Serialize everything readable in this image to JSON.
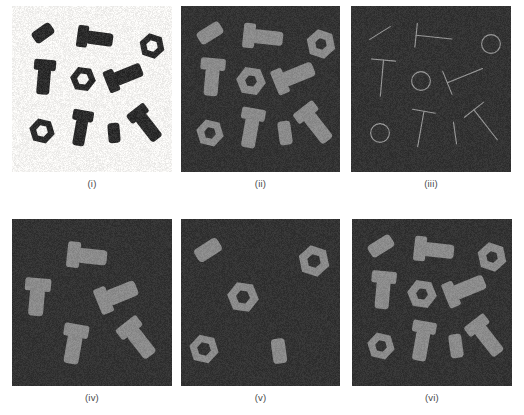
{
  "figure": {
    "width": 524,
    "height": 415,
    "background_color": "#ffffff"
  },
  "colors": {
    "original_background": "#f4f3f1",
    "original_object": "#2b2b2b",
    "binary_background": "#333333",
    "binary_object": "#8b8b8b",
    "skeleton_background": "#333333",
    "skeleton_line": "#9a9a9a",
    "caption_text": "#4a4a4a"
  },
  "panels": [
    {
      "id": "i",
      "caption": "(i)",
      "kind": "grayscale-original",
      "description": "Original grayscale image of bolts, nuts and small cylinders on a light background",
      "background": "#f4f3f1",
      "object_color": "#2b2b2b",
      "object_count": 10,
      "objects": [
        {
          "type": "cylinder",
          "cx": 31,
          "cy": 27,
          "length": 22,
          "width": 13,
          "angle": -35
        },
        {
          "type": "bolt",
          "cx": 83,
          "cy": 32,
          "shaft_length": 36,
          "shaft_width": 13,
          "head_length": 9,
          "head_width": 22,
          "angle": 8
        },
        {
          "type": "nut",
          "cx": 140,
          "cy": 40,
          "radius": 13,
          "hole_radius": 6,
          "angle": 10
        },
        {
          "type": "bolt",
          "cx": 32,
          "cy": 71,
          "shaft_length": 35,
          "shaft_width": 13,
          "head_length": 9,
          "head_width": 22,
          "angle": 95
        },
        {
          "type": "nut",
          "cx": 71,
          "cy": 73,
          "radius": 13,
          "hole_radius": 6,
          "angle": 0
        },
        {
          "type": "bolt",
          "cx": 112,
          "cy": 70,
          "shaft_length": 38,
          "shaft_width": 14,
          "head_length": 9,
          "head_width": 23,
          "angle": -22
        },
        {
          "type": "nut",
          "cx": 30,
          "cy": 125,
          "radius": 13,
          "hole_radius": 6,
          "angle": 5
        },
        {
          "type": "bolt",
          "cx": 69,
          "cy": 122,
          "shaft_length": 36,
          "shaft_width": 12,
          "head_length": 9,
          "head_width": 21,
          "angle": 100
        },
        {
          "type": "cylinder",
          "cx": 102,
          "cy": 127,
          "length": 20,
          "width": 12,
          "angle": 85
        },
        {
          "type": "bolt",
          "cx": 134,
          "cy": 118,
          "shaft_length": 38,
          "shaft_width": 13,
          "head_length": 9,
          "head_width": 22,
          "angle": 52
        }
      ]
    },
    {
      "id": "ii",
      "caption": "(ii)",
      "kind": "binary-threshold",
      "description": "Binary (thresholded) version of the original image, all ten parts segmented as foreground",
      "background": "#333333",
      "object_color": "#8b8b8b",
      "object_count": 10,
      "objects": [
        {
          "type": "cylinder",
          "cx": 29,
          "cy": 27,
          "length": 26,
          "width": 14,
          "angle": -32
        },
        {
          "type": "bolt",
          "cx": 82,
          "cy": 31,
          "shaft_length": 40,
          "shaft_width": 14,
          "head_length": 10,
          "head_width": 25,
          "angle": 6
        },
        {
          "type": "nut",
          "cx": 140,
          "cy": 38,
          "radius": 15,
          "hole_radius": 6,
          "angle": 10
        },
        {
          "type": "bolt",
          "cx": 31,
          "cy": 71,
          "shaft_length": 38,
          "shaft_width": 14,
          "head_length": 10,
          "head_width": 25,
          "angle": 95
        },
        {
          "type": "nut",
          "cx": 70,
          "cy": 75,
          "radius": 15,
          "hole_radius": 6,
          "angle": 0
        },
        {
          "type": "bolt",
          "cx": 113,
          "cy": 70,
          "shaft_length": 42,
          "shaft_width": 15,
          "head_length": 10,
          "head_width": 26,
          "angle": -22
        },
        {
          "type": "nut",
          "cx": 29,
          "cy": 127,
          "radius": 14,
          "hole_radius": 6,
          "angle": 5
        },
        {
          "type": "bolt",
          "cx": 70,
          "cy": 122,
          "shaft_length": 40,
          "shaft_width": 14,
          "head_length": 10,
          "head_width": 24,
          "angle": 100
        },
        {
          "type": "cylinder",
          "cx": 104,
          "cy": 127,
          "length": 24,
          "width": 13,
          "angle": 82
        },
        {
          "type": "bolt",
          "cx": 134,
          "cy": 118,
          "shaft_length": 42,
          "shaft_width": 14,
          "head_length": 10,
          "head_width": 25,
          "angle": 52
        }
      ]
    },
    {
      "id": "iii",
      "caption": "(iii)",
      "kind": "skeleton",
      "description": "Morphological skeleton (thinning) of the binary image: bolts become T shapes, nuts become rings, cylinders become short strokes",
      "background": "#333333",
      "object_color": "#9a9a9a",
      "object_count": 10,
      "objects": [
        {
          "type": "stroke",
          "cx": 29,
          "cy": 27,
          "length": 24,
          "angle": -32
        },
        {
          "type": "tee",
          "cx": 82,
          "cy": 31,
          "stem_length": 38,
          "bar_length": 24,
          "angle": 6
        },
        {
          "type": "ring",
          "cx": 140,
          "cy": 38,
          "radius": 13
        },
        {
          "type": "tee",
          "cx": 31,
          "cy": 71,
          "stem_length": 38,
          "bar_length": 24,
          "angle": 95
        },
        {
          "type": "ring",
          "cx": 70,
          "cy": 75,
          "radius": 13
        },
        {
          "type": "tee",
          "cx": 113,
          "cy": 70,
          "stem_length": 40,
          "bar_length": 25,
          "angle": -22
        },
        {
          "type": "ring",
          "cx": 29,
          "cy": 127,
          "radius": 13
        },
        {
          "type": "tee",
          "cx": 70,
          "cy": 122,
          "stem_length": 38,
          "bar_length": 23,
          "angle": 100
        },
        {
          "type": "stroke",
          "cx": 104,
          "cy": 127,
          "length": 22,
          "angle": 82
        },
        {
          "type": "tee",
          "cx": 134,
          "cy": 118,
          "stem_length": 40,
          "bar_length": 24,
          "angle": 52
        }
      ]
    },
    {
      "id": "iv",
      "caption": "(iv)",
      "kind": "bolts-only",
      "description": "Result of opening with an elongated structuring element: only the five bolts remain",
      "background": "#333333",
      "object_color": "#8b8b8b",
      "object_count": 5,
      "objects": [
        {
          "type": "bolt",
          "cx": 75,
          "cy": 37,
          "shaft_length": 40,
          "shaft_width": 15,
          "head_length": 11,
          "head_width": 26,
          "angle": 6
        },
        {
          "type": "bolt",
          "cx": 25,
          "cy": 78,
          "shaft_length": 38,
          "shaft_width": 15,
          "head_length": 11,
          "head_width": 26,
          "angle": 95
        },
        {
          "type": "bolt",
          "cx": 105,
          "cy": 76,
          "shaft_length": 42,
          "shaft_width": 16,
          "head_length": 11,
          "head_width": 27,
          "angle": -22
        },
        {
          "type": "bolt",
          "cx": 62,
          "cy": 125,
          "shaft_length": 40,
          "shaft_width": 15,
          "head_length": 11,
          "head_width": 25,
          "angle": 100
        },
        {
          "type": "bolt",
          "cx": 126,
          "cy": 120,
          "shaft_length": 42,
          "shaft_width": 15,
          "head_length": 11,
          "head_width": 26,
          "angle": 52
        }
      ]
    },
    {
      "id": "v",
      "caption": "(v)",
      "kind": "nuts-and-cylinders-only",
      "description": "Result of removing the bolts: only the three nuts and two small cylinders remain",
      "background": "#333333",
      "object_color": "#8b8b8b",
      "object_count": 5,
      "objects": [
        {
          "type": "cylinder",
          "cx": 27,
          "cy": 31,
          "length": 27,
          "width": 15,
          "angle": -32
        },
        {
          "type": "nut",
          "cx": 133,
          "cy": 42,
          "radius": 16,
          "hole_radius": 7,
          "angle": 10
        },
        {
          "type": "nut",
          "cx": 62,
          "cy": 78,
          "radius": 16,
          "hole_radius": 7,
          "angle": 0
        },
        {
          "type": "nut",
          "cx": 23,
          "cy": 130,
          "radius": 15,
          "hole_radius": 7,
          "angle": 5
        },
        {
          "type": "cylinder",
          "cx": 98,
          "cy": 132,
          "length": 25,
          "width": 14,
          "angle": 82
        }
      ]
    },
    {
      "id": "vi",
      "caption": "(vi)",
      "kind": "reconstructed",
      "description": "Union of the bolt image and the nut/cylinder image, reconstructing all ten parts",
      "background": "#333333",
      "object_color": "#8b8b8b",
      "object_count": 10,
      "objects": [
        {
          "type": "cylinder",
          "cx": 29,
          "cy": 27,
          "length": 26,
          "width": 14,
          "angle": -32
        },
        {
          "type": "bolt",
          "cx": 82,
          "cy": 31,
          "shaft_length": 40,
          "shaft_width": 14,
          "head_length": 10,
          "head_width": 25,
          "angle": 6
        },
        {
          "type": "nut",
          "cx": 140,
          "cy": 38,
          "radius": 15,
          "hole_radius": 6,
          "angle": 10
        },
        {
          "type": "bolt",
          "cx": 31,
          "cy": 71,
          "shaft_length": 38,
          "shaft_width": 14,
          "head_length": 10,
          "head_width": 25,
          "angle": 95
        },
        {
          "type": "nut",
          "cx": 70,
          "cy": 75,
          "radius": 15,
          "hole_radius": 6,
          "angle": 0
        },
        {
          "type": "bolt",
          "cx": 113,
          "cy": 70,
          "shaft_length": 42,
          "shaft_width": 15,
          "head_length": 10,
          "head_width": 26,
          "angle": -22
        },
        {
          "type": "nut",
          "cx": 29,
          "cy": 127,
          "radius": 14,
          "hole_radius": 6,
          "angle": 5
        },
        {
          "type": "bolt",
          "cx": 70,
          "cy": 122,
          "shaft_length": 40,
          "shaft_width": 14,
          "head_length": 10,
          "head_width": 24,
          "angle": 100
        },
        {
          "type": "cylinder",
          "cx": 104,
          "cy": 127,
          "length": 24,
          "width": 13,
          "angle": 82
        },
        {
          "type": "bolt",
          "cx": 134,
          "cy": 118,
          "shaft_length": 42,
          "shaft_width": 14,
          "head_length": 10,
          "head_width": 25,
          "angle": 52
        }
      ]
    }
  ]
}
